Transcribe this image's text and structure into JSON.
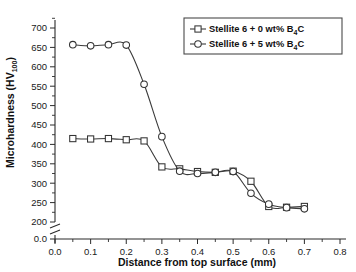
{
  "chart_data": {
    "type": "line",
    "title": "",
    "xlabel": "Distance from top surface (mm)",
    "ylabel": "Microhardness (HV100)",
    "ylabel_main": "Microhardness (HV",
    "ylabel_sub": "100",
    "ylabel_tail": ")",
    "xlim": [
      0.0,
      0.8
    ],
    "ylim": [
      200,
      700
    ],
    "y_axis_break": true,
    "y_break_label": "0.0",
    "grid": false,
    "legend_position": "top-right",
    "xticks": [
      "0.0",
      "0.1",
      "0.2",
      "0.3",
      "0.4",
      "0.5",
      "0.6",
      "0.7",
      "0.8"
    ],
    "xtick_values": [
      0.0,
      0.1,
      0.2,
      0.3,
      0.4,
      0.5,
      0.6,
      0.7,
      0.8
    ],
    "yticks": [
      "0.0",
      "200",
      "250",
      "300",
      "350",
      "400",
      "450",
      "500",
      "550",
      "600",
      "650",
      "700"
    ],
    "ytick_values": [
      200,
      250,
      300,
      350,
      400,
      450,
      500,
      550,
      600,
      650,
      700
    ],
    "series": [
      {
        "name": "Stellite 6 + 0 wt% B4C",
        "label_main": "Stellite 6 + 0 wt% B",
        "label_sub": "4",
        "label_tail": "C",
        "marker": "square",
        "x": [
          0.05,
          0.1,
          0.15,
          0.2,
          0.25,
          0.3,
          0.35,
          0.4,
          0.45,
          0.5,
          0.55,
          0.6,
          0.65,
          0.7
        ],
        "values": [
          415,
          414,
          415,
          412,
          409,
          342,
          337,
          330,
          328,
          331,
          305,
          240,
          238,
          240
        ]
      },
      {
        "name": "Stellite 6 + 5 wt% B4C",
        "label_main": "Stellite 6 + 5 wt% B",
        "label_sub": "4",
        "label_tail": "C",
        "marker": "circle",
        "x": [
          0.05,
          0.1,
          0.15,
          0.2,
          0.25,
          0.3,
          0.35,
          0.4,
          0.45,
          0.5,
          0.55,
          0.6,
          0.65,
          0.7
        ],
        "values": [
          657,
          654,
          657,
          656,
          555,
          420,
          331,
          325,
          328,
          330,
          274,
          246,
          237,
          234
        ]
      }
    ]
  }
}
